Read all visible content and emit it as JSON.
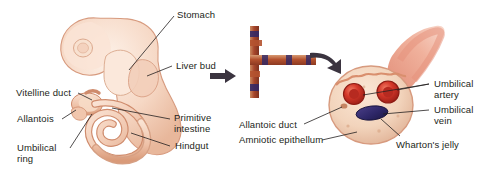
{
  "figure": {
    "background_color": "#ffffff",
    "width": 495,
    "height": 180
  },
  "panels": {
    "left": {
      "name": "embryo-sagittal-section",
      "description": "Sagittal view of embryo showing gut derivatives and body stalk"
    },
    "middle": {
      "name": "vessel-junction",
      "description": "Cross arrangement of umbilical vessels"
    },
    "right": {
      "name": "umbilical-cord-cross-section",
      "description": "Cross section of umbilical cord"
    }
  },
  "arrows": [
    {
      "name": "arrow-embryo-to-vessels",
      "direction": "right"
    },
    {
      "name": "arrow-vessels-to-cord",
      "direction": "down-right-curved"
    }
  ],
  "labels": {
    "stomach": "Stomach",
    "liver_bud": "Liver bud",
    "primitive_intestine": "Primitive\nintestine",
    "hindgut": "Hindgut",
    "vitelline_duct": "Vitelline duct",
    "allantois": "Allantois",
    "umbilical_ring": "Umbilical\nring",
    "allantoic_duct": "Allantoic duct",
    "amniotic_epithelium": "Amniotic epithellum",
    "whartons_jelly": "Wharton's jelly",
    "umbilical_artery": "Umbilical\nartery",
    "umbilical_vein": "Umbilical\nvein"
  },
  "colors": {
    "text": "#231f20",
    "leader_line": "#231f20",
    "embryo_fill_light": "#f7ded0",
    "embryo_fill_mid": "#efc4ae",
    "embryo_outline": "#d79a7e",
    "gut_fill": "#f3cdb8",
    "gut_outline": "#cf8b6c",
    "arrow_dark": "#3b3440",
    "cord_jelly": "#f0d5c0",
    "cord_rim": "#d79a7e",
    "artery_red": "#c0271f",
    "artery_core": "#e24b3a",
    "vein_blue": "#322a6e",
    "vessel_wall_tan": "#c98a60",
    "cord_stalk_pink": "#e8937f"
  }
}
